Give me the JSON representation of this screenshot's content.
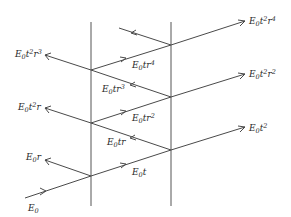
{
  "diagram": {
    "labels": {
      "incident": {
        "base": "E",
        "sub": "0",
        "rest": "",
        "sup": ""
      },
      "reflected_1": {
        "base": "E",
        "sub": "0",
        "rest": "r",
        "sup": ""
      },
      "transmitted_1": {
        "base": "E",
        "sub": "0",
        "rest": "t",
        "sup": ""
      },
      "internal_back_1": {
        "base": "E",
        "sub": "0",
        "rest": "tr",
        "sup": ""
      },
      "out_right_1": {
        "base": "E",
        "sub": "0",
        "rest": "t",
        "sup": "2"
      },
      "out_left_2": {
        "base": "E",
        "sub": "0",
        "rest": "t",
        "sup": "2",
        "rest2": "r"
      },
      "internal_fwd_2": {
        "base": "E",
        "sub": "0",
        "rest": "tr",
        "sup": "2"
      },
      "internal_back_2": {
        "base": "E",
        "sub": "0",
        "rest": "tr",
        "sup": "3"
      },
      "out_right_2": {
        "base": "E",
        "sub": "0",
        "rest": "t",
        "sup": "2",
        "rest2": "r",
        "sup2": "2"
      },
      "out_left_3": {
        "base": "E",
        "sub": "0",
        "rest": "t",
        "sup": "2",
        "rest2": "r",
        "sup2": "3"
      },
      "internal_fwd_3": {
        "base": "E",
        "sub": "0",
        "rest": "tr",
        "sup": "4"
      },
      "out_right_3": {
        "base": "E",
        "sub": "0",
        "rest": "t",
        "sup": "2",
        "rest2": "r",
        "sup2": "4"
      }
    }
  }
}
